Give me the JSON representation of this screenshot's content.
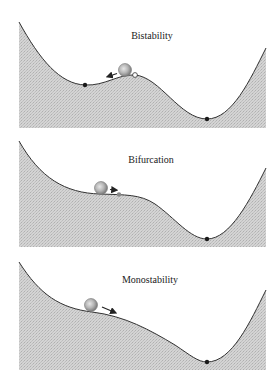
{
  "panels": [
    {
      "title": "Bistability",
      "states": [
        "stable-left",
        "unstable-peak",
        "stable-right"
      ],
      "ball_direction": "left"
    },
    {
      "title": "Bifurcation",
      "states": [
        "saddle-node",
        "stable-right"
      ],
      "ball_direction": "right"
    },
    {
      "title": "Monostability",
      "states": [
        "stable-right"
      ],
      "ball_direction": "right"
    }
  ],
  "colors": {
    "fill": "#d0d0d0",
    "hatch": "#b4b4b4",
    "curve": "#333333",
    "ball_outer": "#8a8a8a",
    "ball_inner": "#cfcfcf",
    "stable_point": "#1a1a1a",
    "unstable_point": "#ffffff",
    "saddle_point": "#888888"
  }
}
